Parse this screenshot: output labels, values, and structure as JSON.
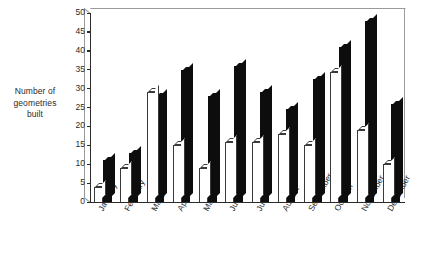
{
  "chart_data": {
    "type": "bar",
    "title": "",
    "subtitle": "",
    "xlabel": "",
    "ylabel": "Number of geometries built",
    "ylim": [
      0,
      50
    ],
    "yticks": [
      0,
      5,
      10,
      15,
      20,
      25,
      30,
      35,
      40,
      45,
      50
    ],
    "ytick_labels": [
      "0",
      "5",
      "10",
      "15",
      "20",
      "25",
      "30",
      "35",
      "40",
      "45",
      "50"
    ],
    "grid": false,
    "legend": null,
    "grouped": true,
    "categories": [
      "January",
      "February",
      "March",
      "April",
      "May",
      "June",
      "July",
      "August",
      "September",
      "October",
      "November",
      "December"
    ],
    "series": [
      {
        "name": "open",
        "style": "white-outlined",
        "color": "#ffffff",
        "edge_color": "#3a3a3a",
        "values": [
          4,
          9,
          29,
          15,
          9,
          16,
          16,
          18,
          15,
          34.5,
          19,
          10
        ]
      },
      {
        "name": "filled",
        "style": "black-filled",
        "color": "#0d0d0d",
        "edge_color": "#0d0d0d",
        "values": [
          11,
          13,
          28,
          35,
          28,
          36,
          29,
          24.5,
          32.5,
          41,
          48,
          26
        ]
      }
    ]
  },
  "axis": {
    "y_title": "Number of geometries built",
    "y_title_lines": [
      "Number of",
      "geometries",
      "built"
    ]
  },
  "colors": {
    "ink": "#1a1a1a",
    "axis": "#2b2b2b",
    "bar_filled": "#0d0d0d",
    "bar_open_edge": "#3a3a3a",
    "background": "#ffffff",
    "frame_depth": "#9a9a9a"
  }
}
